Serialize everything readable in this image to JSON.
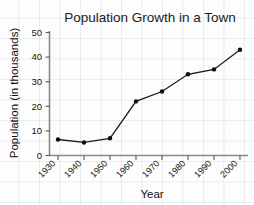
{
  "chart_data": {
    "type": "line",
    "title": "Population Growth in a Town",
    "xlabel": "Year",
    "ylabel": "Population (in thousands)",
    "categories": [
      "1930",
      "1940",
      "1950",
      "1960",
      "1970",
      "1980",
      "1990",
      "2000"
    ],
    "values": [
      6.5,
      5.3,
      7,
      22,
      26,
      33,
      35,
      43
    ],
    "series": [
      {
        "name": "Population",
        "values": [
          6.5,
          5.3,
          7,
          22,
          26,
          33,
          35,
          43
        ]
      }
    ],
    "ylim": [
      0,
      50
    ],
    "ytick_labels": [
      "0",
      "10",
      "20",
      "30",
      "40",
      "50"
    ],
    "ytick_values": [
      0,
      10,
      20,
      30,
      40,
      50
    ],
    "xtick_labels": [
      "1930",
      "1940",
      "1950",
      "1960",
      "1970",
      "1980",
      "1990",
      "2000"
    ],
    "grid": false,
    "legend": "none",
    "marker": "filled-circle",
    "line_color": "#1a1a1a",
    "marker_color": "#0d0d0d",
    "background_color": "#fdfdfd",
    "grid_paper_color": "#b9c8d2"
  },
  "labels": {
    "y_tick_0": "0",
    "y_tick_1": "10",
    "y_tick_2": "20",
    "y_tick_3": "30",
    "y_tick_4": "40",
    "y_tick_5": "50",
    "x_tick_0": "1930",
    "x_tick_1": "1940",
    "x_tick_2": "1950",
    "x_tick_3": "1960",
    "x_tick_4": "1970",
    "x_tick_5": "1980",
    "x_tick_6": "1990",
    "x_tick_7": "2000"
  }
}
